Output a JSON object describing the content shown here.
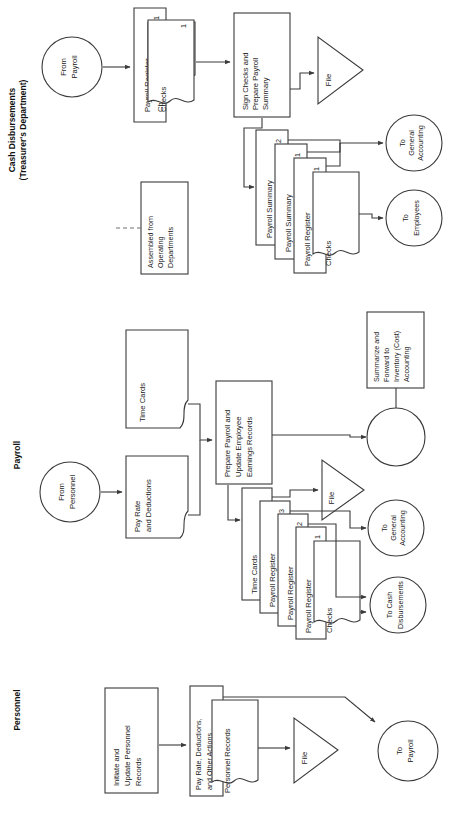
{
  "diagram": {
    "orientation": "rotated-90-ccw",
    "sections": [
      {
        "id": "cash",
        "label": "Cash Disbursements\n(Treasurer's Department)",
        "line1": "Cash Disbursements",
        "line2": "(Treasurer's Department)"
      },
      {
        "id": "payroll",
        "label": "Payroll",
        "line1": "Payroll",
        "line2": ""
      },
      {
        "id": "personnel",
        "label": "Personnel",
        "line1": "Personnel",
        "line2": ""
      }
    ],
    "colors": {
      "stroke": "#3a3a3a",
      "text": "#1a1a1a",
      "background": "#ffffff",
      "dashed": "#707070"
    },
    "nodes": {
      "cash_from_payroll": {
        "type": "connector-circle",
        "lines": [
          "From",
          "Payroll"
        ]
      },
      "cash_payroll_register": {
        "type": "document",
        "lines": [
          "Payroll Register"
        ],
        "copy": "1"
      },
      "cash_checks": {
        "type": "document",
        "lines": [
          "Checks"
        ],
        "copy": ""
      },
      "cash_sign_process": {
        "type": "process",
        "lines": [
          "Sign Checks and",
          "Prepare Payroll",
          "Summary"
        ]
      },
      "cash_file": {
        "type": "file-triangle",
        "lines": [
          "File"
        ]
      },
      "cash_payroll_summary_2": {
        "type": "document",
        "lines": [
          "Payroll Summary"
        ],
        "copy": "2"
      },
      "cash_payroll_summary_1": {
        "type": "document",
        "lines": [
          "Payroll Summary"
        ],
        "copy": "1"
      },
      "cash_payroll_register_1": {
        "type": "document",
        "lines": [
          "Payroll Register"
        ],
        "copy": "1"
      },
      "cash_checks_1": {
        "type": "document",
        "lines": [
          "Checks"
        ],
        "copy": ""
      },
      "cash_to_general_accounting": {
        "type": "connector-circle",
        "lines": [
          "To",
          "General",
          "Accounting"
        ]
      },
      "cash_to_employees": {
        "type": "connector-circle",
        "lines": [
          "To",
          "Employees"
        ]
      },
      "cash_annotation": {
        "type": "annotation",
        "lines": [
          "Assembled from",
          "Operating",
          "Departments"
        ]
      },
      "payroll_from_personnel": {
        "type": "connector-circle",
        "lines": [
          "From",
          "Personnel"
        ]
      },
      "payroll_pay_rate": {
        "type": "document",
        "lines": [
          "Pay Rate",
          "and Deductions"
        ]
      },
      "payroll_time_cards_in": {
        "type": "document",
        "lines": [
          "Time Cards"
        ]
      },
      "payroll_prepare_process": {
        "type": "process",
        "lines": [
          "Prepare Payroll and",
          "Update Employee",
          "Earnings Records"
        ]
      },
      "payroll_time_cards_out": {
        "type": "document",
        "lines": [
          "Time Cards"
        ]
      },
      "payroll_register_3": {
        "type": "document",
        "lines": [
          "Payroll Register"
        ],
        "copy": "3"
      },
      "payroll_register_2": {
        "type": "document",
        "lines": [
          "Payroll Register"
        ],
        "copy": "2"
      },
      "payroll_register_1": {
        "type": "document",
        "lines": [
          "Payroll Register"
        ],
        "copy": "1"
      },
      "payroll_checks": {
        "type": "document",
        "lines": [
          "Checks"
        ],
        "copy": ""
      },
      "payroll_file": {
        "type": "file-triangle",
        "lines": [
          "File"
        ]
      },
      "payroll_summarize_process": {
        "type": "process",
        "lines": [
          "Summarize and",
          "Forward to",
          "Inventory (Cost)",
          "Accounting"
        ]
      },
      "payroll_blank_connector": {
        "type": "connector-circle",
        "lines": []
      },
      "payroll_to_general_accounting": {
        "type": "connector-circle",
        "lines": [
          "To",
          "General",
          "Accounting"
        ]
      },
      "payroll_to_cash_disbursements": {
        "type": "connector-circle",
        "lines": [
          "To Cash",
          "Disbursements"
        ]
      },
      "personnel_initiate_process": {
        "type": "process",
        "lines": [
          "Initiate and",
          "Update Personnel",
          "Records"
        ]
      },
      "personnel_pay_rate_doc": {
        "type": "document",
        "lines": [
          "Pay Rate, Deductions,",
          "and Other Actions"
        ]
      },
      "personnel_records_doc": {
        "type": "document",
        "lines": [
          "Personnel Records"
        ]
      },
      "personnel_file": {
        "type": "file-triangle",
        "lines": [
          "File"
        ]
      },
      "personnel_to_payroll": {
        "type": "connector-circle",
        "lines": [
          "To",
          "Payroll"
        ]
      }
    }
  }
}
